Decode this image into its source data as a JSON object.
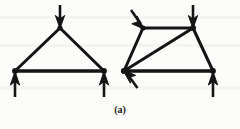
{
  "figure": {
    "caption": "(a)",
    "background_color": "#fcfcfa",
    "line_color": "#141414",
    "diagram_type": "truss-free-body-diagram",
    "panels": [
      {
        "name": "triangular-truss",
        "shape": "triangle",
        "nodes": [
          {
            "id": "apex",
            "x": 60,
            "y": 28
          },
          {
            "id": "bottom-left",
            "x": 15,
            "y": 71
          },
          {
            "id": "bottom-right",
            "x": 104,
            "y": 71
          }
        ],
        "members": [
          {
            "from": "bottom-left",
            "to": "apex"
          },
          {
            "from": "apex",
            "to": "bottom-right"
          },
          {
            "from": "bottom-left",
            "to": "bottom-right"
          }
        ],
        "forces": [
          {
            "name": "apex-load",
            "at": "apex",
            "direction": "down",
            "tail_x": 60,
            "tail_y": 5,
            "head_x": 60,
            "head_y": 28
          },
          {
            "name": "left-reaction",
            "at": "bottom-left",
            "direction": "up",
            "tail_x": 15,
            "tail_y": 97,
            "head_x": 15,
            "head_y": 72
          },
          {
            "name": "right-reaction",
            "at": "bottom-right",
            "direction": "up",
            "tail_x": 104,
            "tail_y": 97,
            "head_x": 104,
            "head_y": 72
          }
        ]
      },
      {
        "name": "trapezoidal-truss",
        "shape": "trapezoid-with-diagonal",
        "nodes": [
          {
            "id": "top-left",
            "x": 143,
            "y": 28
          },
          {
            "id": "top-right",
            "x": 193,
            "y": 28
          },
          {
            "id": "bottom-left",
            "x": 124,
            "y": 71
          },
          {
            "id": "bottom-right",
            "x": 213,
            "y": 71
          }
        ],
        "members": [
          {
            "from": "top-left",
            "to": "top-right"
          },
          {
            "from": "bottom-left",
            "to": "top-left"
          },
          {
            "from": "top-right",
            "to": "bottom-right"
          },
          {
            "from": "bottom-left",
            "to": "bottom-right"
          },
          {
            "from": "bottom-left",
            "to": "top-right"
          }
        ],
        "forces": [
          {
            "name": "top-left-load",
            "at": "top-left",
            "direction": "down-right-diagonal",
            "tail_x": 131,
            "tail_y": 10,
            "head_x": 144,
            "head_y": 28
          },
          {
            "name": "top-right-load",
            "at": "top-right",
            "direction": "down",
            "tail_x": 193,
            "tail_y": 5,
            "head_x": 193,
            "head_y": 28
          },
          {
            "name": "left-reaction",
            "at": "bottom-left",
            "direction": "up-left-diagonal",
            "tail_x": 137,
            "tail_y": 88,
            "head_x": 123,
            "head_y": 70
          },
          {
            "name": "right-reaction",
            "at": "bottom-right",
            "direction": "up",
            "tail_x": 213,
            "tail_y": 97,
            "head_x": 213,
            "head_y": 72
          }
        ]
      }
    ]
  }
}
